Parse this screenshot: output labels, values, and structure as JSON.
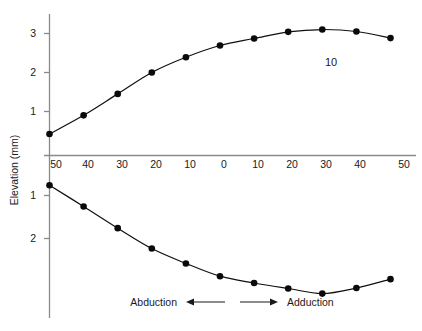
{
  "chart_data": {
    "type": "line",
    "title": "",
    "subtitle": "",
    "xlabel": "",
    "ylabel": "Elevation (mm)",
    "grid": false,
    "legend": "none",
    "xlim": [
      -50,
      50
    ],
    "ylim_upper": [
      0,
      3.5
    ],
    "ylim_lower": [
      0,
      3.0
    ],
    "x_tick_labels": [
      "50",
      "40",
      "30",
      "20",
      "10",
      "0",
      "10",
      "20",
      "30",
      "40",
      "50"
    ],
    "x_tick_values": [
      -50,
      -40,
      -30,
      -20,
      -10,
      0,
      10,
      20,
      30,
      40,
      50
    ],
    "y_tick_labels_upper": [
      "1",
      "2",
      "3"
    ],
    "y_tick_values_upper": [
      1,
      2,
      3
    ],
    "y_tick_labels_lower": [
      "1",
      "2"
    ],
    "y_tick_values_lower": [
      1,
      2
    ],
    "annotations": [
      {
        "text": "10",
        "x": 27,
        "y_upper": 2.35
      }
    ],
    "direction_labels": {
      "left": "Abduction",
      "right": "Adduction"
    },
    "series": [
      {
        "name": "upper-curve",
        "axis": "upper",
        "x": [
          -50,
          -40,
          -30,
          -20,
          -10,
          0,
          10,
          20,
          30,
          40,
          50
        ],
        "values": [
          0.55,
          1.03,
          1.58,
          2.13,
          2.52,
          2.82,
          3.0,
          3.17,
          3.23,
          3.18,
          3.01
        ]
      },
      {
        "name": "lower-curve",
        "axis": "lower",
        "x": [
          -50,
          -40,
          -30,
          -20,
          -10,
          0,
          10,
          20,
          30,
          40,
          50
        ],
        "values": [
          0.37,
          0.87,
          1.38,
          1.86,
          2.21,
          2.51,
          2.67,
          2.8,
          2.92,
          2.79,
          2.58
        ]
      }
    ]
  },
  "axis": {
    "y_label": "Elevation (mm)"
  },
  "annotation": {
    "value": "10"
  },
  "direction": {
    "abduction": "Abduction",
    "adduction": "Adduction"
  },
  "xticks": {
    "t0": "50",
    "t1": "40",
    "t2": "30",
    "t3": "20",
    "t4": "10",
    "t5": "0",
    "t6": "10",
    "t7": "20",
    "t8": "30",
    "t9": "40",
    "t10": "50"
  },
  "yticks_upper": {
    "u1": "1",
    "u2": "2",
    "u3": "3"
  },
  "yticks_lower": {
    "l1": "1",
    "l2": "2"
  },
  "colors": {
    "curve": "#101010",
    "axis": "#8a8a8a",
    "text": "#1a1a1a",
    "background": "#ffffff"
  }
}
